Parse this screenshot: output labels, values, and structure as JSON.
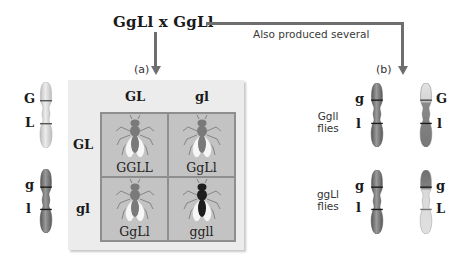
{
  "cross": {
    "title": "GgLl x GgLl",
    "branch_note": "Also produced several"
  },
  "part_a": {
    "label": "(a)",
    "parent_chromosomes": [
      {
        "shade": "light",
        "alleles": [
          "G",
          "L"
        ]
      },
      {
        "shade": "dark",
        "alleles": [
          "g",
          "l"
        ]
      }
    ],
    "punnett": {
      "column_gametes": [
        "GL",
        "gl"
      ],
      "row_gametes": [
        "GL",
        "gl"
      ],
      "cells": [
        {
          "genotype": "GGLL",
          "fly_color": "grey"
        },
        {
          "genotype": "GgLl",
          "fly_color": "grey"
        },
        {
          "genotype": "GgLl",
          "fly_color": "grey"
        },
        {
          "genotype": "ggll",
          "fly_color": "black"
        }
      ]
    }
  },
  "part_b": {
    "label": "(b)",
    "groups": [
      {
        "genotype_label": "Ggll",
        "flies_label": "flies",
        "chromosomes": [
          {
            "shade": "dark",
            "alleles": [
              "g",
              "l"
            ]
          },
          {
            "shade": "light-top-dark-bottom",
            "alleles": [
              "G",
              "l"
            ]
          }
        ]
      },
      {
        "genotype_label": "ggLl",
        "flies_label": "flies",
        "chromosomes": [
          {
            "shade": "dark",
            "alleles": [
              "g",
              "l"
            ]
          },
          {
            "shade": "dark-top-light-bottom",
            "alleles": [
              "g",
              "L"
            ]
          }
        ]
      }
    ]
  },
  "colors": {
    "arrow": "#6e6e6e",
    "panel_bg": "#ececec",
    "cell_bg": "#c3c3c3",
    "chrom_light": "#d9d9d9",
    "chrom_dark": "#7d7d7d",
    "fly_black": "#1e1e1e"
  }
}
